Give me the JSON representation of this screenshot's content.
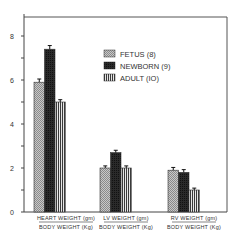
{
  "chart_data": {
    "type": "bar",
    "title": "",
    "xlabel": "",
    "ylabel": "",
    "ylim": [
      0,
      8.8
    ],
    "yticks": [
      0,
      2,
      4,
      6,
      8
    ],
    "grid": false,
    "legend_position": "upper right",
    "categories": [
      {
        "line1": "HEART  WEIGHT (gm)",
        "line2": "BODY  WEIGHT (Kg)"
      },
      {
        "line1": "LV  WEIGHT (gm)",
        "line2": "BODY  WEIGHT (Kg)"
      },
      {
        "line1": "RV  WEIGHT (gm)",
        "line2": "BODY  WEIGHT (Kg)"
      }
    ],
    "series": [
      {
        "name": "FETUS (8)",
        "pattern": "crosshatch",
        "values": [
          5.9,
          2.0,
          1.9
        ],
        "errors": [
          0.1,
          0.05,
          0.08
        ]
      },
      {
        "name": "NEWBORN (9)",
        "pattern": "dark",
        "values": [
          7.4,
          2.7,
          1.8
        ],
        "errors": [
          0.12,
          0.06,
          0.08
        ]
      },
      {
        "name": "ADULT (IO)",
        "pattern": "vertical-stripes",
        "values": [
          5.0,
          2.0,
          1.0
        ],
        "errors": [
          0.06,
          0.05,
          0.04
        ]
      }
    ]
  }
}
